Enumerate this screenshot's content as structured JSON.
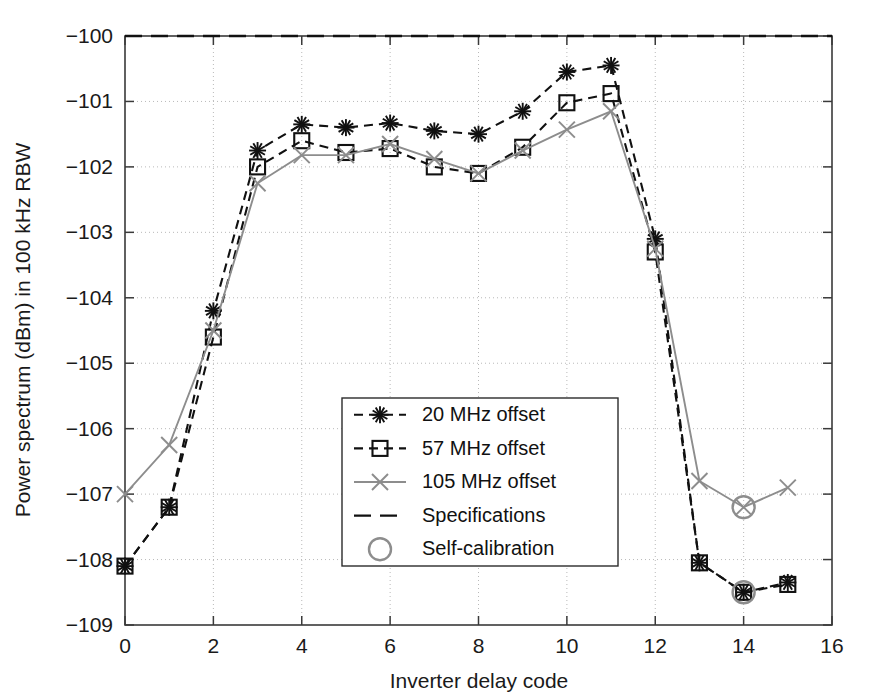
{
  "chart_data": {
    "type": "line",
    "title": "",
    "xlabel": "Inverter delay code",
    "ylabel": "Power spectrum (dBm) in 100 kHz RBW",
    "xlim": [
      0,
      16
    ],
    "ylim": [
      -109,
      -100
    ],
    "xticks": [
      0,
      2,
      4,
      6,
      8,
      10,
      12,
      14,
      16
    ],
    "xtick_labels": [
      "0",
      "2",
      "4",
      "6",
      "8",
      "10",
      "12",
      "14",
      "16"
    ],
    "yticks": [
      -109,
      -108,
      -107,
      -106,
      -105,
      -104,
      -103,
      -102,
      -101,
      -100
    ],
    "ytick_labels": [
      "−109",
      "−108",
      "−107",
      "−106",
      "−105",
      "−104",
      "−103",
      "−102",
      "−101",
      "−100"
    ],
    "grid": true,
    "legend_position": "center",
    "x": [
      0,
      1,
      2,
      3,
      4,
      5,
      6,
      7,
      8,
      9,
      10,
      11,
      12,
      13,
      14,
      15
    ],
    "series": [
      {
        "name": "20 MHz offset",
        "marker": "star",
        "linestyle": "dashed",
        "color": "#111111",
        "values": [
          -108.1,
          -107.2,
          -104.2,
          -101.75,
          -101.35,
          -101.4,
          -101.33,
          -101.45,
          -101.5,
          -101.15,
          -100.55,
          -100.45,
          -103.1,
          -108.05,
          -108.5,
          -108.35
        ]
      },
      {
        "name": "57 MHz offset",
        "marker": "square",
        "linestyle": "dashed",
        "color": "#111111",
        "values": [
          -108.1,
          -107.2,
          -104.6,
          -102.0,
          -101.6,
          -101.78,
          -101.72,
          -102.0,
          -102.1,
          -101.7,
          -101.02,
          -100.88,
          -103.3,
          -108.05,
          -108.5,
          -108.38
        ]
      },
      {
        "name": "105 MHz offset",
        "marker": "cross",
        "linestyle": "solid",
        "color": "#8d8d8d",
        "values": [
          -107.0,
          -106.25,
          -104.5,
          -102.25,
          -101.82,
          -101.82,
          -101.65,
          -101.88,
          -102.1,
          -101.75,
          -101.43,
          -101.15,
          -103.25,
          -106.8,
          -107.2,
          -106.9
        ]
      }
    ],
    "spec_line": {
      "name": "Specifications",
      "value": -100.0,
      "linestyle": "dashed",
      "color": "#111111"
    },
    "self_calibration": {
      "name": "Self-calibration",
      "marker": "circle",
      "points": [
        {
          "x": 14,
          "y": -107.2
        },
        {
          "x": 14,
          "y": -108.5
        }
      ]
    },
    "legend": [
      {
        "label": "20 MHz offset",
        "marker": "star",
        "linestyle": "dashed",
        "color": "#111111"
      },
      {
        "label": "57 MHz offset",
        "marker": "square",
        "linestyle": "dashed",
        "color": "#111111"
      },
      {
        "label": "105 MHz offset",
        "marker": "cross",
        "linestyle": "solid",
        "color": "#8d8d8d"
      },
      {
        "label": "Specifications",
        "marker": "none",
        "linestyle": "dashed",
        "color": "#111111"
      },
      {
        "label": "Self-calibration",
        "marker": "circle",
        "linestyle": "none",
        "color": "#8d8d8d"
      }
    ]
  }
}
